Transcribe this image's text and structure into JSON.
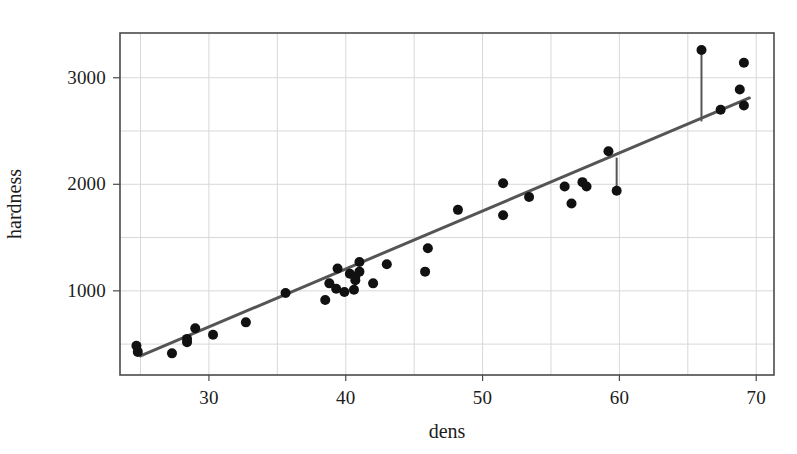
{
  "chart_data": {
    "type": "scatter",
    "title": "",
    "xlabel": "dens",
    "ylabel": "hardness",
    "xlim": [
      23.5,
      71.3
    ],
    "ylim": [
      210,
      3420
    ],
    "xticks": [
      30,
      40,
      50,
      60,
      70
    ],
    "yticks": [
      1000,
      2000,
      3000
    ],
    "xtick_labels": [
      "30",
      "40",
      "50",
      "60",
      "70"
    ],
    "ytick_labels": [
      "1000",
      "2000",
      "3000"
    ],
    "x_minor_gridlines": [
      25,
      35,
      45,
      55,
      65
    ],
    "y_minor_gridlines": [
      500,
      1500,
      2500
    ],
    "grid": true,
    "legend": null,
    "marker_color": "#111111",
    "line_color": "#555555",
    "frame_color": "#4a4a4a",
    "grid_color": "#d8d8d8",
    "background_color": "#ffffff",
    "marker_size": 10,
    "points": [
      {
        "x": 24.7,
        "y": 484
      },
      {
        "x": 24.8,
        "y": 427
      },
      {
        "x": 27.3,
        "y": 413
      },
      {
        "x": 28.4,
        "y": 517
      },
      {
        "x": 28.4,
        "y": 549
      },
      {
        "x": 29.0,
        "y": 648
      },
      {
        "x": 30.3,
        "y": 587
      },
      {
        "x": 32.7,
        "y": 704
      },
      {
        "x": 35.6,
        "y": 979
      },
      {
        "x": 38.5,
        "y": 914
      },
      {
        "x": 38.8,
        "y": 1070
      },
      {
        "x": 39.3,
        "y": 1020
      },
      {
        "x": 39.4,
        "y": 1210
      },
      {
        "x": 39.9,
        "y": 989
      },
      {
        "x": 40.3,
        "y": 1160
      },
      {
        "x": 40.6,
        "y": 1010
      },
      {
        "x": 40.7,
        "y": 1100
      },
      {
        "x": 40.7,
        "y": 1130
      },
      {
        "x": 41.0,
        "y": 1270
      },
      {
        "x": 41.0,
        "y": 1180
      },
      {
        "x": 42.0,
        "y": 1070
      },
      {
        "x": 43.0,
        "y": 1250
      },
      {
        "x": 45.8,
        "y": 1180
      },
      {
        "x": 46.0,
        "y": 1400
      },
      {
        "x": 48.2,
        "y": 1760
      },
      {
        "x": 51.5,
        "y": 1710
      },
      {
        "x": 51.5,
        "y": 2010
      },
      {
        "x": 53.4,
        "y": 1880
      },
      {
        "x": 56.0,
        "y": 1980
      },
      {
        "x": 56.5,
        "y": 1820
      },
      {
        "x": 57.3,
        "y": 2020
      },
      {
        "x": 57.6,
        "y": 1980
      },
      {
        "x": 59.2,
        "y": 2310
      },
      {
        "x": 59.8,
        "y": 1940
      },
      {
        "x": 66.0,
        "y": 3260
      },
      {
        "x": 67.4,
        "y": 2700
      },
      {
        "x": 68.8,
        "y": 2890
      },
      {
        "x": 69.1,
        "y": 2740
      },
      {
        "x": 69.1,
        "y": 3140
      }
    ],
    "fit_line": {
      "name": "least-squares fit",
      "x1": 25.0,
      "y1": 390,
      "x2": 69.5,
      "y2": 2810
    },
    "residual_segments": [
      {
        "x": 66.0,
        "y_point": 3260,
        "y_line": 2590
      },
      {
        "x": 59.8,
        "y_point": 1940,
        "y_line": 2250
      }
    ]
  },
  "axes": {
    "x_title": "dens",
    "y_title": "hardness"
  }
}
